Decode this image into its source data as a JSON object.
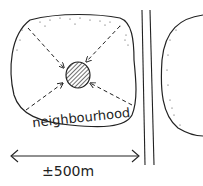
{
  "diagram": {
    "area_label": "neighbourhood",
    "distance_label": "±500m",
    "colors": {
      "ink": "#222222",
      "background": "#ffffff"
    }
  }
}
